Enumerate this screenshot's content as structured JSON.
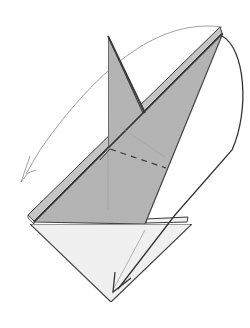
{
  "diagram": {
    "colors": {
      "background": "#ffffff",
      "paper_colored": "#b4b4b4",
      "paper_colored_light": "#c4c4c4",
      "paper_white": "#f2f2f2",
      "edge": "#3a3a3a",
      "thin_arrow": "#888888",
      "bold_arrow": "#333333"
    },
    "elements": [
      {
        "name": "tall-flap",
        "kind": "colored paper flap"
      },
      {
        "name": "long-arm-flap",
        "kind": "colored paper flap"
      },
      {
        "name": "bottom-triangle",
        "kind": "white paper side"
      },
      {
        "name": "valley-fold-line",
        "kind": "dashed fold line"
      },
      {
        "name": "swing-arrow-left",
        "kind": "thin arrow, flap swings to the left"
      },
      {
        "name": "swing-arrow-down",
        "kind": "bold arrow, flap swings down to the bottom point"
      }
    ]
  }
}
